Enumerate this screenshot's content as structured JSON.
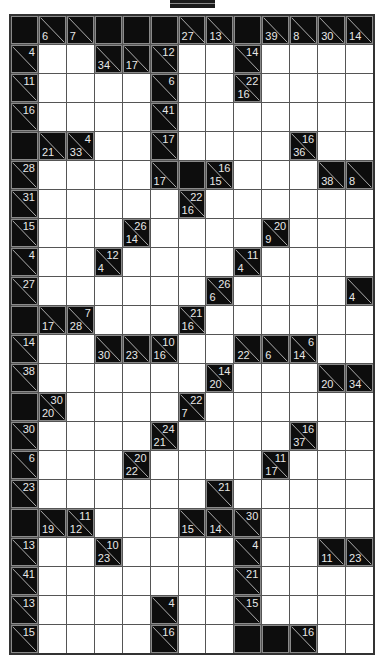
{
  "puzzle": {
    "type": "kakuro",
    "columns": 13,
    "rows": 22,
    "legend": "X = blocked, W = empty white cell, [down,right] = clue cell (null when absent)",
    "grid": [
      [
        "X",
        [
          6,
          null
        ],
        [
          7,
          null
        ],
        "X",
        "X",
        "X",
        [
          27,
          null
        ],
        [
          13,
          null
        ],
        "X",
        [
          39,
          null
        ],
        [
          8,
          null
        ],
        [
          30,
          null
        ],
        [
          14,
          null
        ]
      ],
      [
        [
          null,
          4
        ],
        "W",
        "W",
        [
          34,
          null
        ],
        [
          17,
          null
        ],
        [
          null,
          12
        ],
        "W",
        "W",
        [
          null,
          14
        ],
        "W",
        "W",
        "W",
        "W"
      ],
      [
        [
          null,
          11
        ],
        "W",
        "W",
        "W",
        "W",
        [
          null,
          6
        ],
        "W",
        "W",
        [
          16,
          22
        ],
        "W",
        "W",
        "W",
        "W"
      ],
      [
        [
          null,
          16
        ],
        "W",
        "W",
        "W",
        "W",
        [
          null,
          41
        ],
        "W",
        "W",
        "W",
        "W",
        "W",
        "W",
        "W"
      ],
      [
        "X",
        [
          21,
          null
        ],
        [
          33,
          4
        ],
        "W",
        "W",
        [
          null,
          17
        ],
        "W",
        "W",
        "W",
        "W",
        [
          36,
          16
        ],
        "W",
        "W"
      ],
      [
        [
          null,
          28
        ],
        "W",
        "W",
        "W",
        "W",
        [
          17,
          null
        ],
        "X",
        [
          15,
          16
        ],
        "W",
        "W",
        "W",
        [
          38,
          null
        ],
        [
          8,
          null
        ]
      ],
      [
        [
          null,
          31
        ],
        "W",
        "W",
        "W",
        "W",
        "W",
        [
          16,
          22
        ],
        "W",
        "W",
        "W",
        "W",
        "W",
        "W"
      ],
      [
        [
          null,
          15
        ],
        "W",
        "W",
        "W",
        [
          14,
          26
        ],
        "W",
        "W",
        "W",
        "W",
        [
          9,
          20
        ],
        "W",
        "W",
        "W"
      ],
      [
        [
          null,
          4
        ],
        "W",
        "W",
        [
          4,
          12
        ],
        "W",
        "W",
        "W",
        "W",
        [
          4,
          11
        ],
        "W",
        "W",
        "W",
        "W"
      ],
      [
        [
          null,
          27
        ],
        "W",
        "W",
        "W",
        "W",
        "W",
        "W",
        [
          6,
          26
        ],
        "W",
        "W",
        "W",
        "W",
        [
          4,
          null
        ]
      ],
      [
        "X",
        [
          17,
          null
        ],
        [
          28,
          7
        ],
        "W",
        "W",
        "W",
        [
          16,
          21
        ],
        "W",
        "W",
        "W",
        "W",
        "W",
        "W"
      ],
      [
        [
          null,
          14
        ],
        "W",
        "W",
        [
          30,
          null
        ],
        [
          23,
          null
        ],
        [
          16,
          10
        ],
        "W",
        "W",
        [
          22,
          null
        ],
        [
          6,
          null
        ],
        [
          14,
          6
        ],
        "W",
        "W"
      ],
      [
        [
          null,
          38
        ],
        "W",
        "W",
        "W",
        "W",
        "W",
        "W",
        [
          20,
          14
        ],
        "W",
        "W",
        "W",
        [
          20,
          null
        ],
        [
          34,
          null
        ]
      ],
      [
        "X",
        [
          20,
          30
        ],
        "W",
        "W",
        "W",
        "W",
        [
          7,
          22
        ],
        "W",
        "W",
        "W",
        "W",
        "W",
        "W"
      ],
      [
        [
          null,
          30
        ],
        "W",
        "W",
        "W",
        "W",
        [
          21,
          24
        ],
        "W",
        "W",
        "W",
        "W",
        [
          37,
          16
        ],
        "W",
        "W"
      ],
      [
        [
          null,
          6
        ],
        "W",
        "W",
        "W",
        [
          22,
          20
        ],
        "W",
        "W",
        "W",
        "W",
        [
          17,
          11
        ],
        "W",
        "W",
        "W"
      ],
      [
        [
          null,
          23
        ],
        "W",
        "W",
        "W",
        "W",
        "W",
        "W",
        [
          null,
          21
        ],
        "W",
        "W",
        "W",
        "W",
        "W"
      ],
      [
        "X",
        [
          19,
          null
        ],
        [
          12,
          11
        ],
        "W",
        "W",
        "W",
        [
          15,
          null
        ],
        [
          14,
          null
        ],
        [
          null,
          30
        ],
        "W",
        "W",
        "W",
        "W"
      ],
      [
        [
          null,
          13
        ],
        "W",
        "W",
        [
          23,
          10
        ],
        "W",
        "W",
        "W",
        "W",
        [
          null,
          4
        ],
        "W",
        "W",
        [
          11,
          null
        ],
        [
          23,
          null
        ]
      ],
      [
        [
          null,
          41
        ],
        "W",
        "W",
        "W",
        "W",
        "W",
        "W",
        "W",
        [
          null,
          21
        ],
        "W",
        "W",
        "W",
        "W"
      ],
      [
        [
          null,
          13
        ],
        "W",
        "W",
        "W",
        "W",
        [
          null,
          4
        ],
        "W",
        "W",
        [
          null,
          15
        ],
        "W",
        "W",
        "W",
        "W"
      ],
      [
        [
          null,
          15
        ],
        "W",
        "W",
        "W",
        "W",
        [
          null,
          16
        ],
        "W",
        "W",
        "X",
        "X",
        [
          null,
          16
        ],
        "W",
        "W"
      ]
    ]
  }
}
